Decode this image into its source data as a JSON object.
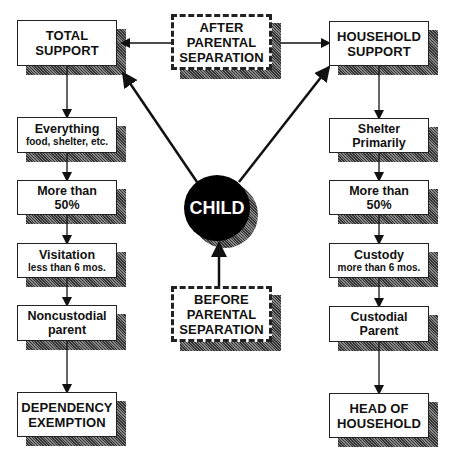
{
  "diagram": {
    "center": {
      "after_label": [
        "AFTER",
        "PARENTAL",
        "SEPARATION"
      ],
      "child_label": "CHILD",
      "before_label": [
        "BEFORE",
        "PARENTAL",
        "SEPARATION"
      ]
    },
    "left_column": {
      "top": [
        "TOTAL",
        "SUPPORT"
      ],
      "steps": [
        {
          "main": "Everything",
          "sub": "food, shelter, etc."
        },
        {
          "main": "More than",
          "main2": "50%"
        },
        {
          "main": "Visitation",
          "sub": "less than 6 mos."
        },
        {
          "main": "Noncustodial",
          "main2": "parent"
        }
      ],
      "bottom": [
        "DEPENDENCY",
        "EXEMPTION"
      ]
    },
    "right_column": {
      "top": [
        "HOUSEHOLD",
        "SUPPORT"
      ],
      "steps": [
        {
          "main": "Shelter",
          "main2": "Primarily"
        },
        {
          "main": "More than",
          "main2": "50%"
        },
        {
          "main": "Custody",
          "sub": "more than 6 mos."
        },
        {
          "main": "Custodial",
          "main2": "Parent"
        }
      ],
      "bottom": [
        "HEAD OF",
        "HOUSEHOLD"
      ]
    },
    "caption": ""
  }
}
